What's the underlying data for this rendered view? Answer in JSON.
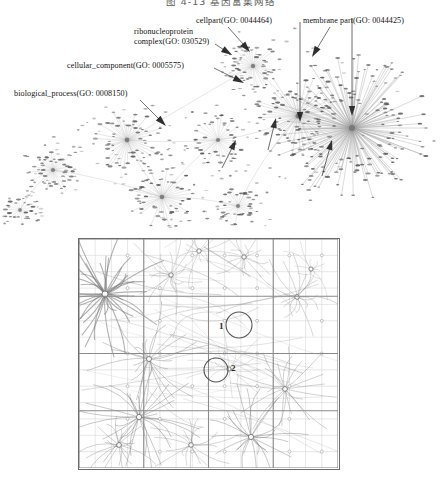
{
  "figure_caption": {
    "text": "图 4-13  基因富集网络"
  },
  "network_figure": {
    "name": "gene-ontology-network",
    "annotations": [
      {
        "id": "cellpart",
        "label": "cellpart(GO:  0044464)",
        "x": 196,
        "y": 16,
        "arrow": {
          "x1": 228,
          "y1": 27,
          "x2": 250,
          "y2": 52
        }
      },
      {
        "id": "membrane-part",
        "label": "membrane part(GO:  0044425)",
        "x": 303,
        "y": 16,
        "arrow": {
          "x1": 330,
          "y1": 27,
          "x2": 312,
          "y2": 57
        }
      },
      {
        "id": "ribonucleoprotein",
        "label": "ribonucleoprotein complex(GO:  030529)",
        "x": 134,
        "y": 27,
        "arrow": {
          "x1": 215,
          "y1": 44,
          "x2": 232,
          "y2": 55
        }
      },
      {
        "id": "cellular-component",
        "label": "cellular_component(GO:  0005575)",
        "x": 67,
        "y": 61,
        "arrow": {
          "x1": 214,
          "y1": 68,
          "x2": 244,
          "y2": 83
        }
      },
      {
        "id": "biological-process",
        "label": "biological_process(GO:  0008150)",
        "x": 14,
        "y": 89,
        "arrow": {
          "x1": 140,
          "y1": 100,
          "x2": 166,
          "y2": 126
        }
      }
    ],
    "hubs": [
      {
        "name": "hub-biological-process",
        "cx": 127,
        "cy": 130,
        "spokes": 46,
        "r": 30,
        "weight": 0.55
      },
      {
        "name": "hub-cellular-component",
        "cx": 162,
        "cy": 187,
        "spokes": 40,
        "r": 28,
        "weight": 0.5
      },
      {
        "name": "hub-ribonucleoprotein",
        "cx": 253,
        "cy": 56,
        "spokes": 34,
        "r": 22,
        "weight": 0.45
      },
      {
        "name": "hub-cellpart",
        "cx": 298,
        "cy": 106,
        "spokes": 58,
        "r": 40,
        "weight": 0.6
      },
      {
        "name": "hub-membrane-part",
        "cx": 352,
        "cy": 118,
        "spokes": 150,
        "r": 68,
        "weight": 0.9
      },
      {
        "name": "hub-small-left",
        "cx": 53,
        "cy": 160,
        "spokes": 34,
        "r": 20,
        "weight": 0.4
      },
      {
        "name": "hub-small-mid",
        "cx": 218,
        "cy": 130,
        "spokes": 30,
        "r": 24,
        "weight": 0.4
      },
      {
        "name": "hub-lower-mid",
        "cx": 238,
        "cy": 196,
        "spokes": 26,
        "r": 20,
        "weight": 0.35
      },
      {
        "name": "hub-far-left",
        "cx": 20,
        "cy": 200,
        "spokes": 18,
        "r": 13,
        "weight": 0.3
      }
    ],
    "bridges": [
      [
        127,
        130,
        253,
        56
      ],
      [
        127,
        130,
        162,
        187
      ],
      [
        162,
        187,
        238,
        196
      ],
      [
        253,
        56,
        298,
        106
      ],
      [
        298,
        106,
        352,
        118
      ],
      [
        218,
        130,
        298,
        106
      ],
      [
        53,
        160,
        162,
        187
      ],
      [
        20,
        200,
        53,
        160
      ],
      [
        127,
        130,
        218,
        130
      ],
      [
        238,
        196,
        298,
        106
      ],
      [
        162,
        187,
        218,
        130
      ]
    ]
  },
  "grid_figure": {
    "name": "spatial-cluster-grid",
    "cols": 16,
    "rows": 14,
    "coarse_cols": 4,
    "coarse_rows": 4,
    "markers": [
      {
        "label": "1",
        "x": 140,
        "y": 82
      },
      {
        "label": "2",
        "x": 152,
        "y": 124
      }
    ],
    "circles": [
      {
        "name": "highlight-circle-1",
        "cx": 160,
        "cy": 86,
        "r": 13
      },
      {
        "name": "highlight-circle-2",
        "cx": 137,
        "cy": 131,
        "r": 12
      }
    ],
    "clusters": [
      {
        "cx": 26,
        "cy": 55,
        "rays": 40,
        "r": 52,
        "w": 0.85
      },
      {
        "cx": 70,
        "cy": 120,
        "rays": 24,
        "r": 46,
        "w": 0.55
      },
      {
        "cx": 92,
        "cy": 36,
        "rays": 18,
        "r": 40,
        "w": 0.4
      },
      {
        "cx": 120,
        "cy": 12,
        "rays": 14,
        "r": 30,
        "w": 0.35
      },
      {
        "cx": 165,
        "cy": 18,
        "rays": 16,
        "r": 26,
        "w": 0.4
      },
      {
        "cx": 218,
        "cy": 58,
        "rays": 18,
        "r": 34,
        "w": 0.45
      },
      {
        "cx": 232,
        "cy": 30,
        "rays": 12,
        "r": 26,
        "w": 0.3
      },
      {
        "cx": 60,
        "cy": 178,
        "rays": 28,
        "r": 48,
        "w": 0.6
      },
      {
        "cx": 40,
        "cy": 206,
        "rays": 20,
        "r": 34,
        "w": 0.5
      },
      {
        "cx": 112,
        "cy": 206,
        "rays": 18,
        "r": 32,
        "w": 0.45
      },
      {
        "cx": 172,
        "cy": 198,
        "rays": 26,
        "r": 42,
        "w": 0.6
      },
      {
        "cx": 206,
        "cy": 150,
        "rays": 22,
        "r": 44,
        "w": 0.5
      },
      {
        "cx": 150,
        "cy": 130,
        "rays": 14,
        "r": 34,
        "w": 0.3
      }
    ]
  },
  "colors": {
    "frame": "#6b6b6b",
    "fine_grid": "#cfcfcf",
    "coarse_grid": "#8a8a8a",
    "edge": "#9a9a9a",
    "node": "#8e8e8e",
    "arrow": "#1a1a1a",
    "text": "#111111"
  }
}
